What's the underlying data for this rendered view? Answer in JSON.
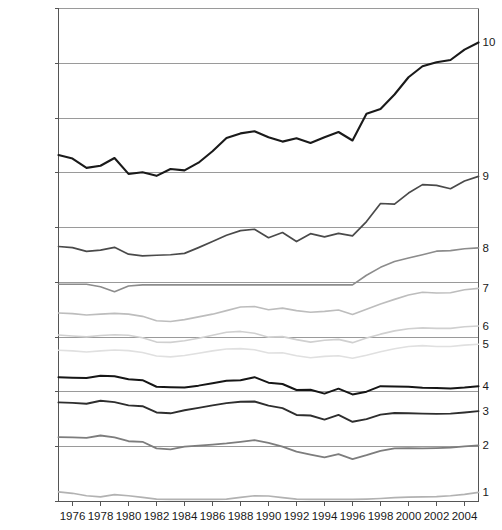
{
  "chart_data": {
    "type": "line",
    "title": "",
    "subtitle": "",
    "xlabel": "",
    "ylabel": "",
    "xlim": [
      1975,
      2005
    ],
    "ylim": [
      0,
      180000
    ],
    "grid": true,
    "legend_position": "right-inline",
    "y_tick_values": [
      0,
      20000,
      40000,
      60000,
      80000,
      100000,
      120000,
      140000,
      160000,
      180000
    ],
    "y_tick_labels": [
      "0",
      "$ 20,000",
      "$ 40,000",
      "$ 60,000",
      "$ 80,000",
      "$ 100,000",
      "$ 120,000",
      "$ 140,000",
      "$ 160,000",
      "$ 180,000"
    ],
    "x_tick_values": [
      1976,
      1978,
      1980,
      1982,
      1984,
      1986,
      1988,
      1990,
      1992,
      1994,
      1996,
      1998,
      2000,
      2002,
      2004
    ],
    "x_tick_labels": [
      "1976",
      "1978",
      "1980",
      "1982",
      "1984",
      "1986",
      "1988",
      "1990",
      "1992",
      "1994",
      "1996",
      "1998",
      "2000",
      "2002",
      "2004"
    ],
    "x": [
      1975,
      1976,
      1977,
      1978,
      1979,
      1980,
      1981,
      1982,
      1983,
      1984,
      1985,
      1986,
      1987,
      1988,
      1989,
      1990,
      1991,
      1992,
      1993,
      1994,
      1995,
      1996,
      1997,
      1998,
      1999,
      2000,
      2001,
      2002,
      2003,
      2004,
      2005
    ],
    "series": [
      {
        "name": "10",
        "label": "10",
        "color": "#1a1a1a",
        "width": 2.1,
        "values": [
          126500,
          125200,
          121800,
          122600,
          125400,
          119600,
          120200,
          118900,
          121400,
          120900,
          123700,
          127900,
          132700,
          134400,
          135200,
          133000,
          131400,
          132600,
          130900,
          133000,
          134900,
          131800,
          141600,
          143300,
          148600,
          154900,
          158900,
          160400,
          161200,
          165000,
          167600
        ]
      },
      {
        "name": "9",
        "label": "9",
        "color": "#4a4a4a",
        "width": 1.7,
        "values": [
          93100,
          92700,
          91300,
          91800,
          92800,
          90300,
          89700,
          89900,
          90100,
          90600,
          92700,
          94900,
          97200,
          98900,
          99400,
          96300,
          98200,
          94900,
          97800,
          96600,
          97900,
          97000,
          102200,
          108800,
          108600,
          112600,
          115700,
          115400,
          114200,
          117000,
          118700
        ]
      },
      {
        "name": "8",
        "label": "8",
        "color": "#8c8c8c",
        "width": 1.6,
        "values": [
          79300,
          79300,
          79300,
          78400,
          76600,
          78700,
          79100,
          79100,
          79100,
          79100,
          79100,
          79100,
          79100,
          79100,
          79100,
          79100,
          79100,
          79100,
          79100,
          79100,
          79100,
          79100,
          82600,
          85500,
          87600,
          88900,
          90100,
          91400,
          91600,
          92300,
          92600
        ]
      },
      {
        "name": "7",
        "label": "7",
        "color": "#bdbdbd",
        "width": 1.6,
        "values": [
          68800,
          68600,
          68100,
          68400,
          68700,
          68400,
          67600,
          66000,
          65700,
          66400,
          67400,
          68400,
          69700,
          71000,
          71200,
          70000,
          70600,
          69700,
          69100,
          69400,
          69900,
          68300,
          70200,
          72100,
          73800,
          75400,
          76400,
          76100,
          76200,
          77300,
          77800
        ]
      },
      {
        "name": "6",
        "label": "6",
        "color": "#d0d0d0",
        "width": 1.6,
        "values": [
          60800,
          60400,
          60100,
          60600,
          60900,
          60700,
          59800,
          58200,
          58100,
          58700,
          59600,
          60700,
          61800,
          62100,
          61400,
          60000,
          60200,
          59100,
          58200,
          58900,
          59200,
          58000,
          59700,
          61100,
          62300,
          63100,
          63400,
          63200,
          63200,
          63800,
          64100
        ]
      },
      {
        "name": "5",
        "label": "5",
        "color": "#e0e0e0",
        "width": 1.6,
        "values": [
          55200,
          55000,
          54600,
          55000,
          55300,
          55100,
          54400,
          53100,
          52800,
          53300,
          54100,
          55000,
          55700,
          55800,
          55400,
          54200,
          54300,
          53200,
          52500,
          53000,
          53200,
          52300,
          53400,
          54700,
          55800,
          56600,
          56900,
          56600,
          56600,
          57100,
          57400
        ]
      },
      {
        "name": "4",
        "label": "4",
        "color": "#161616",
        "width": 2.0,
        "values": [
          45400,
          45200,
          45100,
          45900,
          45700,
          44600,
          44300,
          41900,
          41700,
          41600,
          42300,
          43200,
          44100,
          44300,
          45400,
          43400,
          42900,
          40700,
          40800,
          39400,
          41200,
          39100,
          40100,
          42100,
          42000,
          41900,
          41500,
          41400,
          41300,
          41600,
          42100
        ]
      },
      {
        "name": "3",
        "label": "3",
        "color": "#2e2e2e",
        "width": 1.9,
        "values": [
          36200,
          36000,
          35700,
          36800,
          36300,
          35100,
          34800,
          32500,
          32200,
          33300,
          34200,
          35100,
          35900,
          36400,
          36500,
          35000,
          34100,
          31600,
          31400,
          29900,
          31600,
          29100,
          30100,
          31700,
          32300,
          32200,
          32100,
          32000,
          32100,
          32500,
          33000
        ]
      },
      {
        "name": "2",
        "label": "2",
        "color": "#7d7d7d",
        "width": 1.8,
        "values": [
          23500,
          23400,
          23200,
          24100,
          23400,
          22000,
          21800,
          19400,
          19000,
          20000,
          20400,
          20800,
          21200,
          21800,
          22400,
          21400,
          20000,
          18200,
          17100,
          16100,
          17300,
          15500,
          16900,
          18500,
          19400,
          19500,
          19400,
          19500,
          19700,
          20100,
          20500
        ]
      },
      {
        "name": "1",
        "label": "1",
        "color": "#b2b2b2",
        "width": 1.7,
        "values": [
          3500,
          3000,
          2100,
          1700,
          2500,
          2100,
          1500,
          900,
          800,
          800,
          800,
          800,
          900,
          1500,
          2100,
          2000,
          1400,
          900,
          800,
          800,
          800,
          800,
          900,
          1100,
          1400,
          1600,
          1700,
          1800,
          2100,
          2600,
          3300
        ]
      }
    ]
  }
}
